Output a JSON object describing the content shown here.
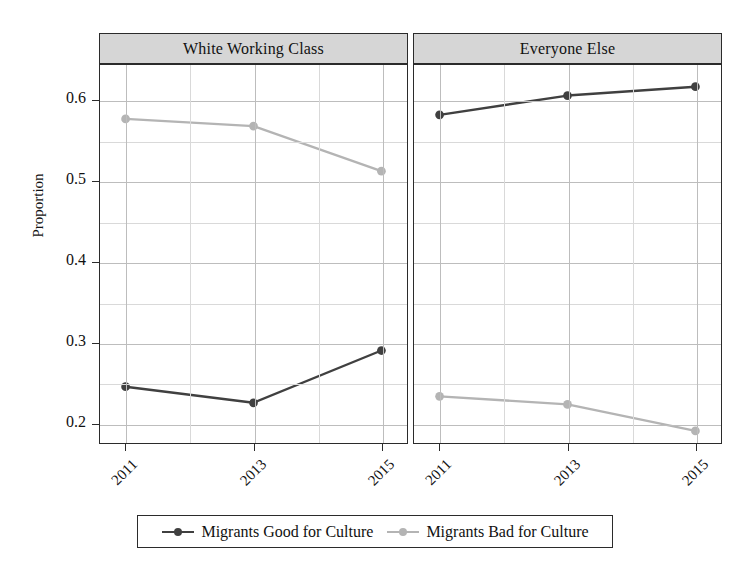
{
  "chart_data": {
    "type": "line",
    "title": "",
    "xlabel": "",
    "ylabel": "Proportion",
    "categories": [
      "2011",
      "2013",
      "2015"
    ],
    "x": [
      2011,
      2013,
      2015
    ],
    "xlim": [
      2010.6,
      2015.4
    ],
    "ylim": [
      0.175,
      0.645
    ],
    "yticks": [
      0.2,
      0.3,
      0.4,
      0.5,
      0.6
    ],
    "ytick_labels": [
      "0.2",
      "0.3",
      "0.4",
      "0.5",
      "0.6"
    ],
    "xticks": [
      2011,
      2013,
      2015
    ],
    "xtick_labels": [
      "2011",
      "2013",
      "2015"
    ],
    "grid": true,
    "grid_minor_y_step": 0.05,
    "grid_minor_x_step": 1,
    "legend_position": "bottom",
    "facets": [
      {
        "name": "White Working Class",
        "series": [
          {
            "name": "Migrants Good for Culture",
            "color": "#404040",
            "values": [
              0.245,
              0.225,
              0.29
            ]
          },
          {
            "name": "Migrants Bad for Culture",
            "color": "#b4b4b4",
            "values": [
              0.578,
              0.569,
              0.513
            ]
          }
        ]
      },
      {
        "name": "Everyone Else",
        "series": [
          {
            "name": "Migrants Good for Culture",
            "color": "#404040",
            "values": [
              0.583,
              0.607,
              0.618
            ]
          },
          {
            "name": "Migrants Bad for Culture",
            "color": "#b4b4b4",
            "values": [
              0.233,
              0.223,
              0.19
            ]
          }
        ]
      }
    ],
    "legend": [
      {
        "label": "Migrants Good for Culture",
        "color": "#404040"
      },
      {
        "label": "Migrants Bad for Culture",
        "color": "#b4b4b4"
      }
    ]
  },
  "axis": {
    "ylabel": "Proportion",
    "ytick_labels": [
      "0.6",
      "0.5",
      "0.4",
      "0.3",
      "0.2"
    ],
    "xtick_labels": [
      "2011",
      "2013",
      "2015"
    ]
  },
  "panels": {
    "left_title": "White Working Class",
    "right_title": "Everyone Else"
  },
  "legend": {
    "good_label": "Migrants Good for Culture",
    "bad_label": "Migrants Bad for Culture"
  },
  "colors": {
    "good": "#404040",
    "bad": "#b4b4b4",
    "axis": "#2b2b2b",
    "grid": "#c9c9c9",
    "header_fill": "#d6d6d6",
    "background": "#ffffff"
  }
}
